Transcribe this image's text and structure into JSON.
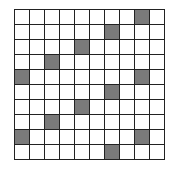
{
  "grid": {
    "rows": 10,
    "cols": 10,
    "shaded_color": "#7a7a7a",
    "shaded_cells": [
      [
        0,
        8
      ],
      [
        1,
        6
      ],
      [
        2,
        4
      ],
      [
        3,
        2
      ],
      [
        4,
        0
      ],
      [
        4,
        8
      ],
      [
        5,
        6
      ],
      [
        6,
        4
      ],
      [
        7,
        2
      ],
      [
        8,
        0
      ],
      [
        8,
        8
      ],
      [
        9,
        6
      ]
    ]
  }
}
